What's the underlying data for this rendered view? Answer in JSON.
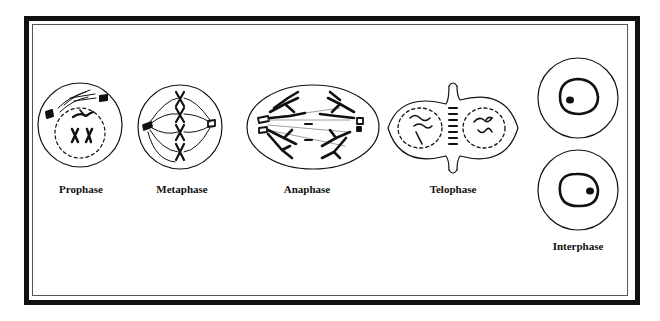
{
  "diagram": {
    "stages": [
      {
        "id": "prophase",
        "label": "Prophase",
        "label_x": 81,
        "label_y": 183
      },
      {
        "id": "metaphase",
        "label": "Metaphase",
        "label_x": 182,
        "label_y": 183
      },
      {
        "id": "anaphase",
        "label": "Anaphase",
        "label_x": 307,
        "label_y": 183
      },
      {
        "id": "telophase",
        "label": "Telophase",
        "label_x": 453,
        "label_y": 183
      },
      {
        "id": "interphase",
        "label": "Interphase",
        "label_x": 578,
        "label_y": 240
      }
    ],
    "colors": {
      "ink": "#111111",
      "background": "#ffffff",
      "spindle": "#888888"
    }
  }
}
